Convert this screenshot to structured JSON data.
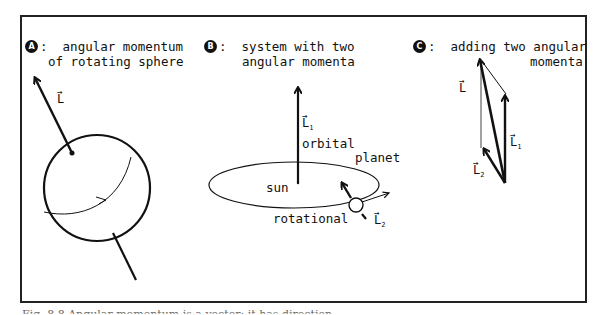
{
  "panels": [
    {
      "badge": "A",
      "title_line1": ":  angular momentum",
      "title_line2": "of rotating sphere",
      "vector_label": "L"
    },
    {
      "badge": "B",
      "title_line1": ":  system with two",
      "title_line2": "angular momenta",
      "labels": {
        "l1": "L",
        "l1_sub": "1",
        "orbital": "orbital",
        "planet": "planet",
        "sun": "sun",
        "rotational": "rotational",
        "l2": "L",
        "l2_sub": "2"
      }
    },
    {
      "badge": "C",
      "title_line1": ":  adding two angular",
      "title_line2": "momenta",
      "labels": {
        "l": "L",
        "l1": "L",
        "l1_sub": "1",
        "l2": "L",
        "l2_sub": "2"
      }
    }
  ],
  "vector_arrow": "→",
  "caption": "Fig. 8.8  Angular momentum is a vector: it has direction"
}
